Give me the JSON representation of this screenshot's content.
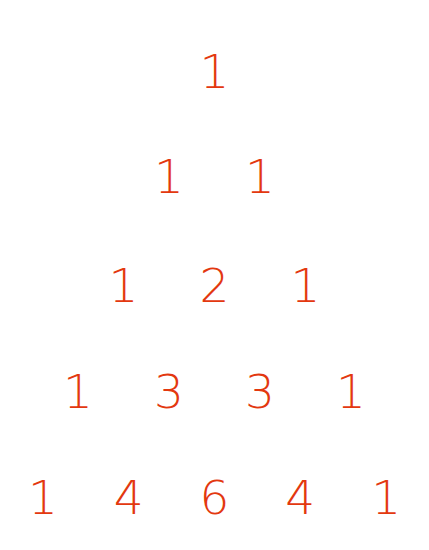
{
  "figure": {
    "name": "pascals-triangle",
    "background_color": "#ffffff",
    "text_color": "#e3380f",
    "row_count": 5,
    "row_spacing_px": 105,
    "column_spacing_px": 91,
    "font_size_px": 47
  },
  "chart_data": {
    "type": "table",
    "title": "",
    "subtitle": "",
    "xlabel": "",
    "ylabel": "",
    "grid": false,
    "legend": false,
    "rows": [
      {
        "n": 0,
        "values": [
          1
        ]
      },
      {
        "n": 1,
        "values": [
          1,
          1
        ]
      },
      {
        "n": 2,
        "values": [
          1,
          2,
          1
        ]
      },
      {
        "n": 3,
        "values": [
          1,
          3,
          3,
          1
        ]
      },
      {
        "n": 4,
        "values": [
          1,
          4,
          6,
          4,
          1
        ]
      }
    ],
    "labels": [
      [
        "1"
      ],
      [
        "1",
        "1"
      ],
      [
        "1",
        "2",
        "1"
      ],
      [
        "1",
        "3",
        "3",
        "1"
      ],
      [
        "1",
        "4",
        "6",
        "4",
        "1"
      ]
    ]
  }
}
